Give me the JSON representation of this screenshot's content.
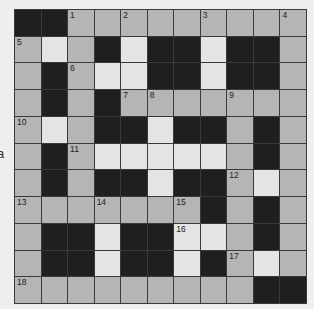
{
  "puzzle": {
    "side_text": "a",
    "rows": 11,
    "cols": 11,
    "colors": {
      "block": "#1f1f1f",
      "shaded": "#b5b5b5",
      "light": "#e4e4e4",
      "border": "#3a3a3a"
    },
    "grid": [
      [
        "B",
        "B",
        "G",
        "G",
        "G",
        "G",
        "G",
        "G",
        "G",
        "G",
        "G"
      ],
      [
        "G",
        "W",
        "G",
        "B",
        "W",
        "B",
        "B",
        "W",
        "B",
        "B",
        "G"
      ],
      [
        "G",
        "B",
        "G",
        "W",
        "W",
        "B",
        "B",
        "W",
        "B",
        "B",
        "G"
      ],
      [
        "G",
        "B",
        "G",
        "B",
        "G",
        "G",
        "G",
        "G",
        "G",
        "G",
        "G"
      ],
      [
        "G",
        "W",
        "G",
        "B",
        "B",
        "W",
        "B",
        "B",
        "G",
        "B",
        "G"
      ],
      [
        "G",
        "B",
        "G",
        "W",
        "W",
        "W",
        "W",
        "W",
        "G",
        "B",
        "G"
      ],
      [
        "G",
        "B",
        "G",
        "B",
        "B",
        "W",
        "B",
        "B",
        "G",
        "W",
        "G"
      ],
      [
        "G",
        "G",
        "G",
        "G",
        "G",
        "G",
        "G",
        "B",
        "G",
        "B",
        "G"
      ],
      [
        "G",
        "B",
        "B",
        "W",
        "B",
        "B",
        "W",
        "W",
        "G",
        "B",
        "G"
      ],
      [
        "G",
        "B",
        "B",
        "W",
        "B",
        "B",
        "W",
        "B",
        "G",
        "W",
        "G"
      ],
      [
        "G",
        "G",
        "G",
        "G",
        "G",
        "G",
        "G",
        "G",
        "G",
        "B",
        "B"
      ]
    ],
    "numbers": [
      {
        "r": 0,
        "c": 2,
        "n": "1"
      },
      {
        "r": 0,
        "c": 4,
        "n": "2"
      },
      {
        "r": 0,
        "c": 7,
        "n": "3"
      },
      {
        "r": 0,
        "c": 10,
        "n": "4"
      },
      {
        "r": 1,
        "c": 0,
        "n": "5"
      },
      {
        "r": 2,
        "c": 2,
        "n": "6"
      },
      {
        "r": 3,
        "c": 4,
        "n": "7"
      },
      {
        "r": 3,
        "c": 5,
        "n": "8"
      },
      {
        "r": 3,
        "c": 8,
        "n": "9"
      },
      {
        "r": 4,
        "c": 0,
        "n": "10"
      },
      {
        "r": 5,
        "c": 2,
        "n": "11"
      },
      {
        "r": 6,
        "c": 8,
        "n": "12"
      },
      {
        "r": 7,
        "c": 0,
        "n": "13"
      },
      {
        "r": 7,
        "c": 3,
        "n": "14"
      },
      {
        "r": 7,
        "c": 6,
        "n": "15"
      },
      {
        "r": 8,
        "c": 6,
        "n": "16"
      },
      {
        "r": 9,
        "c": 8,
        "n": "17"
      },
      {
        "r": 10,
        "c": 0,
        "n": "18"
      }
    ]
  }
}
